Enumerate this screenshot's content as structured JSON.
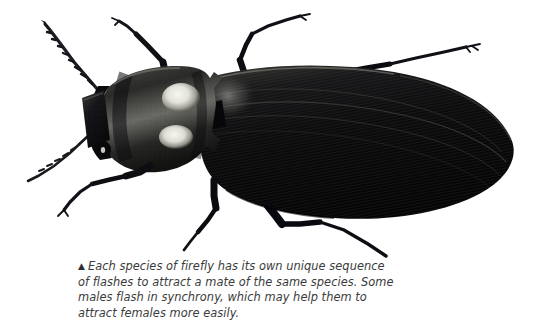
{
  "figure": {
    "medium": "black-and-white scientific illustration",
    "background_color": "#ffffff",
    "ink_color": "#111111",
    "highlight_color": "#f2f2ee",
    "orientation": "dorsal view, head at left, abdomen tip at right",
    "parts": [
      {
        "name": "antenna-left-upper",
        "description": "long serrated antenna angled up-left"
      },
      {
        "name": "antenna-left-lower",
        "description": "shorter serrated antenna angled down-left"
      },
      {
        "name": "head",
        "description": "dark rectangular head capsule with eye"
      },
      {
        "name": "pronotum",
        "description": "broad shield with two pale luminescent spots and pointed hind angles"
      },
      {
        "name": "luminescent-spot-upper",
        "description": "bright oval light organ on pronotum"
      },
      {
        "name": "luminescent-spot-lower",
        "description": "bright oval light organ on pronotum"
      },
      {
        "name": "scutellum",
        "description": "small dark triangular plate behind pronotum"
      },
      {
        "name": "elytra",
        "description": "long tapering wing covers with fine longitudinal striations"
      },
      {
        "name": "leg-front-upper",
        "description": "foreleg reaching up and right"
      },
      {
        "name": "leg-front-lower",
        "description": "foreleg reaching down and left"
      },
      {
        "name": "leg-middle-upper",
        "description": "midleg extending up and right"
      },
      {
        "name": "leg-middle-lower",
        "description": "midleg extending down"
      },
      {
        "name": "leg-hind-upper",
        "description": "hindleg extending far up and right"
      },
      {
        "name": "leg-hind-lower",
        "description": "hindleg extending down and right"
      }
    ]
  },
  "caption": {
    "marker": "▲",
    "lines": [
      "Each species of firefly has its own unique sequence",
      "of flashes to attract a mate of the same species. Some",
      "males flash in synchrony, which may help them to",
      "attract females more easily."
    ],
    "full_text": "▲ Each species of firefly has its own unique sequence of flashes to attract a mate of the same species. Some males flash in synchrony, which may help them to attract females more easily.",
    "text_color": "#3b3b3b"
  }
}
